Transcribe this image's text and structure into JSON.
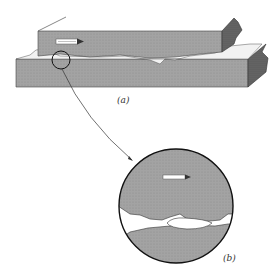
{
  "figure": {
    "panel_a": {
      "label": "(a)",
      "description": "Two rough surfaces in sliding contact; upper block moving right"
    },
    "panel_b": {
      "label": "(b)",
      "description": "Magnified view of contact region showing asperity junction"
    }
  },
  "colors": {
    "block_fill": "#9a9a9a",
    "block_dark": "#5a5a5a",
    "outline": "#222222",
    "gap_fill": "#ffffff"
  },
  "arrow": {
    "direction": "right"
  }
}
